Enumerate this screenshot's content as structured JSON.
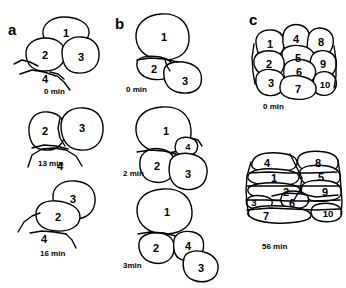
{
  "figure": {
    "type": "scientific-line-drawing",
    "background_color": "#ffffff",
    "line_color": "#000000"
  },
  "panels": [
    {
      "id": "a",
      "letter": "a",
      "frames": [
        {
          "id": "a0",
          "time_label": "0 min",
          "cells": [
            "1",
            "2",
            "3",
            "4"
          ]
        },
        {
          "id": "a13",
          "time_label": "13 min",
          "cells": [
            "2",
            "3",
            "4"
          ]
        },
        {
          "id": "a16",
          "time_label": "16 min",
          "cells": [
            "3",
            "2",
            "4"
          ]
        }
      ]
    },
    {
      "id": "b",
      "letter": "b",
      "frames": [
        {
          "id": "b0",
          "time_label": "0 min",
          "cells": [
            "1",
            "2",
            "3"
          ]
        },
        {
          "id": "b2",
          "time_label": "2 min",
          "cells": [
            "1",
            "4",
            "2",
            "3"
          ]
        },
        {
          "id": "b3",
          "time_label": "3min",
          "cells": [
            "1",
            "2",
            "4",
            "3"
          ]
        }
      ]
    },
    {
      "id": "c",
      "letter": "c",
      "frames": [
        {
          "id": "c0",
          "time_label": "0 min",
          "cells": [
            "1",
            "4",
            "8",
            "5",
            "2",
            "9",
            "6",
            "3",
            "10",
            "7"
          ]
        },
        {
          "id": "c56",
          "time_label": "56 min",
          "cells": [
            "4",
            "8",
            "1",
            "5",
            "2",
            "9",
            "3",
            "6",
            "7",
            "10"
          ]
        }
      ]
    }
  ],
  "labels": {
    "panel_a_letter": "a",
    "panel_b_letter": "b",
    "panel_c_letter": "c",
    "a_t0": "0 min",
    "a_t1": "13 min",
    "a_t2": "16 min",
    "b_t0": "0 min",
    "b_t1": "2 min",
    "b_t2": "3min",
    "c_t0": "0 min",
    "c_t1": "56 min",
    "n1": "1",
    "n2": "2",
    "n3": "3",
    "n4": "4",
    "n5": "5",
    "n6": "6",
    "n7": "7",
    "n8": "8",
    "n9": "9",
    "n10": "10"
  }
}
